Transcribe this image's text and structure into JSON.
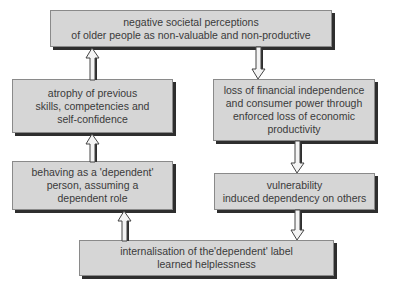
{
  "diagram": {
    "type": "cycle-flowchart",
    "nodes": [
      {
        "id": "n1",
        "label": "negative societal perceptions\nof older people as non-valuable and non-productive"
      },
      {
        "id": "n2",
        "label": "loss of financial independence\nand consumer power through\nenforced loss of economic\nproductivity"
      },
      {
        "id": "n3",
        "label": "vulnerability\ninduced dependency on others"
      },
      {
        "id": "n4",
        "label": "internalisation of the'dependent' label\nlearned helplessness"
      },
      {
        "id": "n5",
        "label": "behaving as a 'dependent'\nperson, assuming a\ndependent role"
      },
      {
        "id": "n6",
        "label": "atrophy of previous\nskills, competencies and\nself-confidence"
      }
    ],
    "edges": [
      {
        "from": "n1",
        "to": "n2",
        "direction": "down"
      },
      {
        "from": "n2",
        "to": "n3",
        "direction": "down"
      },
      {
        "from": "n3",
        "to": "n4",
        "direction": "down"
      },
      {
        "from": "n4",
        "to": "n5",
        "direction": "up"
      },
      {
        "from": "n5",
        "to": "n6",
        "direction": "up"
      },
      {
        "from": "n6",
        "to": "n1",
        "direction": "up"
      }
    ]
  },
  "colors": {
    "box_fill": "#d6d6d6",
    "box_border": "#8a8a8a",
    "shadow": "#2e2e2e",
    "text": "#3a3a3a",
    "arrow_fill": "#f4f4f4"
  }
}
